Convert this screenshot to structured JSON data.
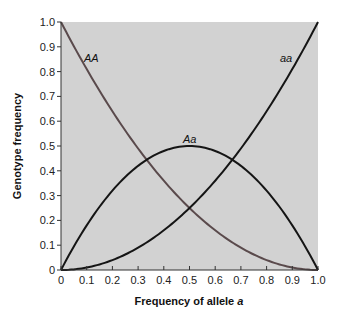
{
  "chart_data": {
    "type": "line",
    "title": "",
    "xlabel": "Frequency of allele a",
    "xlabel_main": "Frequency of allele ",
    "xlabel_italic": "a",
    "ylabel": "Genotype frequency",
    "xlim": [
      0,
      1.0
    ],
    "ylim": [
      0,
      1.0
    ],
    "grid": false,
    "legend": "inline labels",
    "xticks": [
      "0",
      "0.1",
      "0.2",
      "0.3",
      "0.4",
      "0.5",
      "0.6",
      "0.7",
      "0.8",
      "0.9",
      "1.0"
    ],
    "yticks": [
      "0",
      "0.1",
      "0.2",
      "0.3",
      "0.4",
      "0.5",
      "0.6",
      "0.7",
      "0.8",
      "0.9",
      "1.0"
    ],
    "x": [
      0,
      0.1,
      0.2,
      0.3,
      0.4,
      0.5,
      0.6,
      0.7,
      0.8,
      0.9,
      1.0
    ],
    "series": [
      {
        "name": "AA",
        "label": "AA",
        "color": "#5a4a4c",
        "values": [
          1.0,
          0.81,
          0.64,
          0.49,
          0.36,
          0.25,
          0.16,
          0.09,
          0.04,
          0.01,
          0.0
        ]
      },
      {
        "name": "Aa",
        "label": "Aa",
        "color": "#151515",
        "values": [
          0.0,
          0.18,
          0.32,
          0.42,
          0.48,
          0.5,
          0.48,
          0.42,
          0.32,
          0.18,
          0.0
        ]
      },
      {
        "name": "aa",
        "label": "aa",
        "color": "#151515",
        "values": [
          0.0,
          0.01,
          0.04,
          0.09,
          0.16,
          0.25,
          0.36,
          0.49,
          0.64,
          0.81,
          1.0
        ]
      }
    ],
    "colors": {
      "plot_background": "#d2d2d2",
      "axis": "#333333"
    }
  }
}
